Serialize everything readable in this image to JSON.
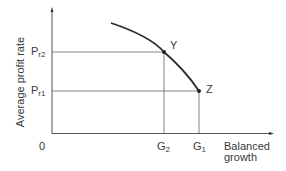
{
  "diagram": {
    "type": "economic-curve",
    "y_axis_label": "Average profit rate",
    "x_axis_label_line1": "Balanced",
    "x_axis_label_line2": "growth",
    "origin_label": "0",
    "y_ticks": [
      {
        "base": "P",
        "sub": "r2"
      },
      {
        "base": "P",
        "sub": "r1"
      }
    ],
    "x_ticks": [
      {
        "base": "G",
        "sub": "2"
      },
      {
        "base": "G",
        "sub": "1"
      }
    ],
    "points": [
      {
        "label": "Y",
        "x_tick": "G2",
        "y_tick": "Pr2"
      },
      {
        "label": "Z",
        "x_tick": "G1",
        "y_tick": "Pr1"
      }
    ],
    "colors": {
      "axis": "#555555",
      "guide_lines": "#666666",
      "curve": "#2a2a2a",
      "text": "#3a3a3a"
    }
  }
}
